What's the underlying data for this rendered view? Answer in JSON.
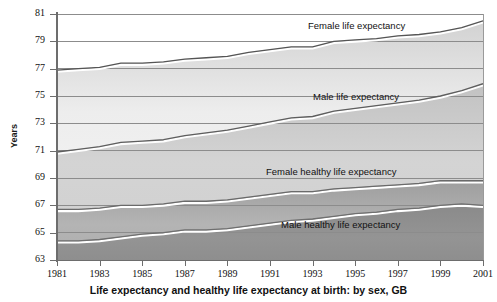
{
  "axis": {
    "ylabel": "Years",
    "yticks": [
      63,
      65,
      67,
      69,
      71,
      73,
      75,
      77,
      79,
      81
    ],
    "xticks": [
      1981,
      1983,
      1985,
      1987,
      1989,
      1991,
      1993,
      1995,
      1997,
      1999,
      2001
    ]
  },
  "title": "Life expectancy and healthy life expectancy at birth: by sex, GB",
  "labels": {
    "female_le": "Female life expectancy",
    "male_le": "Male life expectancy",
    "female_hle": "Female healthy life expectancy",
    "male_hle": "Male healthy life expectancy"
  },
  "colors": {
    "axis": "#6d6d6d",
    "grid": "#8c8c8c",
    "line_dark": "#4a4a4a",
    "line_light": "#ffffff",
    "band_top": "#f2f2f2",
    "band_bottom": "#8f8f8f",
    "text": "#111111"
  },
  "chart_data": {
    "type": "line",
    "title": "Life expectancy and healthy life expectancy at birth: by sex, GB",
    "xlabel": "",
    "ylabel": "Years",
    "xlim": [
      1981,
      2001
    ],
    "ylim": [
      63,
      81
    ],
    "grid": true,
    "legend": "inline-labels",
    "x": [
      1981,
      1982,
      1983,
      1984,
      1985,
      1986,
      1987,
      1988,
      1989,
      1990,
      1991,
      1992,
      1993,
      1994,
      1995,
      1996,
      1997,
      1998,
      1999,
      2000,
      2001
    ],
    "series": [
      {
        "name": "Female life expectancy",
        "values": [
          76.9,
          77.0,
          77.1,
          77.4,
          77.4,
          77.5,
          77.7,
          77.8,
          77.9,
          78.2,
          78.4,
          78.6,
          78.6,
          79.0,
          79.1,
          79.2,
          79.4,
          79.5,
          79.7,
          80.0,
          80.5
        ]
      },
      {
        "name": "Male life expectancy",
        "values": [
          70.9,
          71.1,
          71.3,
          71.6,
          71.7,
          71.8,
          72.1,
          72.3,
          72.5,
          72.8,
          73.1,
          73.4,
          73.5,
          73.9,
          74.1,
          74.3,
          74.5,
          74.7,
          75.0,
          75.4,
          75.9
        ]
      },
      {
        "name": "Female healthy life expectancy",
        "values": [
          66.7,
          66.7,
          66.8,
          67.0,
          67.0,
          67.1,
          67.3,
          67.3,
          67.4,
          67.6,
          67.8,
          68.0,
          68.0,
          68.2,
          68.3,
          68.4,
          68.5,
          68.6,
          68.8,
          68.8,
          68.8
        ]
      },
      {
        "name": "Male healthy life expectancy",
        "values": [
          64.4,
          64.4,
          64.5,
          64.7,
          64.9,
          65.0,
          65.2,
          65.2,
          65.3,
          65.5,
          65.7,
          65.9,
          66.0,
          66.2,
          66.4,
          66.5,
          66.7,
          66.8,
          67.0,
          67.1,
          67.0
        ]
      }
    ]
  }
}
